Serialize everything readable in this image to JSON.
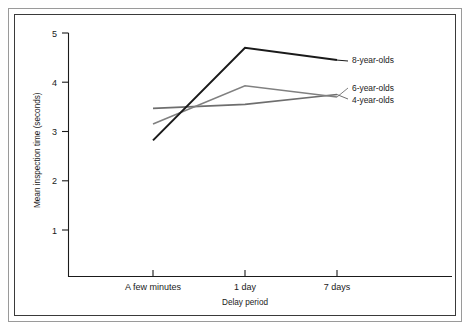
{
  "figure": {
    "background_color": "#ffffff",
    "frame_outer_color": "#9a9a9a",
    "frame_inner_color": "#3a3a3a"
  },
  "chart_data": {
    "type": "line",
    "title": "",
    "xlabel": "Delay period",
    "ylabel": "Mean inspection time (seconds)",
    "categories": [
      "A few minutes",
      "1 day",
      "7 days"
    ],
    "yticks": [
      1,
      2,
      3,
      4,
      5
    ],
    "ylim": [
      0,
      5
    ],
    "grid": false,
    "legend_position": "right-inline",
    "series": [
      {
        "name": "8-year-olds",
        "label": "8-year-olds",
        "color": "#1a1a1a",
        "stroke_width": 2.0,
        "values": [
          2.82,
          4.7,
          4.45
        ]
      },
      {
        "name": "6-year-olds",
        "label": "6-year-olds",
        "color": "#808080",
        "stroke_width": 1.6,
        "values": [
          3.15,
          3.93,
          3.7
        ]
      },
      {
        "name": "4-year-olds",
        "label": "4-year-olds",
        "color": "#6e6e6e",
        "stroke_width": 1.6,
        "values": [
          3.47,
          3.55,
          3.75
        ]
      }
    ]
  },
  "axis": {
    "y_tick_labels": [
      "5",
      "4",
      "3",
      "2",
      "1"
    ],
    "x_tick_labels": [
      "A few minutes",
      "1 day",
      "7 days"
    ],
    "y_axis_title": "Mean inspection time (seconds)",
    "x_axis_title": "Delay period"
  },
  "legend": {
    "items": [
      {
        "label": "8-year-olds"
      },
      {
        "label": "6-year-olds"
      },
      {
        "label": "4-year-olds"
      }
    ]
  }
}
